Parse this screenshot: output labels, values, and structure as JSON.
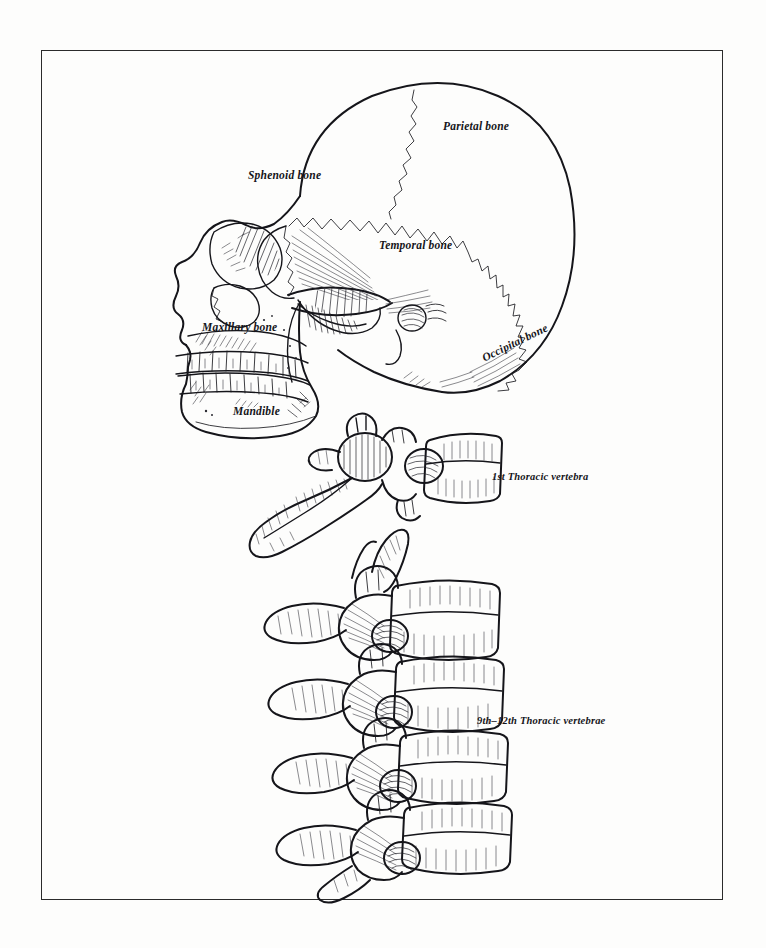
{
  "plate": {
    "background_color": "#fdfdfc",
    "ink_color": "#15151a",
    "border_color": "#2b2b2b",
    "description": "Pen-and-ink anatomical plate: lateral view of human skull with labeled cranial bones, plus thoracic vertebrae"
  },
  "labels": {
    "parietal": "Parietal bone",
    "sphenoid": "Sphenoid bone",
    "temporal": "Temporal bone",
    "occipital": "Occipital bone",
    "maxillary": "Maxillary bone",
    "mandible": "Mandible",
    "thoracic_first": "1st Thoracic vertebra",
    "thoracic_range": "9th–12th Thoracic vertebrae"
  },
  "figures": [
    {
      "name": "lateral-skull",
      "label_count": 6
    },
    {
      "name": "first-thoracic-vertebra",
      "label_count": 1
    },
    {
      "name": "ninth-to-twelfth-thoracic-vertebrae",
      "label_count": 1
    }
  ]
}
